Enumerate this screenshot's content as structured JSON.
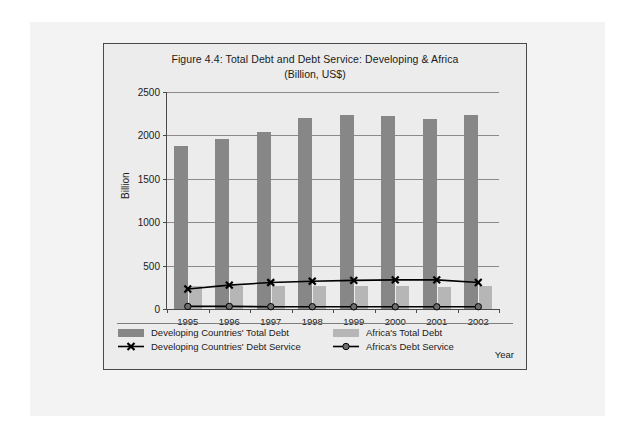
{
  "figure": {
    "title": "Figure 4.4: Total Debt and Debt Service: Developing & Africa",
    "subtitle": "(Billion, US$)",
    "axis_title_y": "Billion",
    "axis_title_x": "Year"
  },
  "legend": {
    "items": [
      {
        "label": "Developing Countries' Total Debt",
        "marker": "swatch-dark-gray"
      },
      {
        "label": "Developing Countries' Debt Service",
        "marker": "line-with-x-marker"
      },
      {
        "label": "Africa's Total Debt",
        "marker": "swatch-light-gray"
      },
      {
        "label": "Africa's Debt Service",
        "marker": "line-with-dot-marker"
      }
    ]
  },
  "yticks": [
    "0",
    "500",
    "1000",
    "1500",
    "2000",
    "2500"
  ],
  "colors": {
    "bar_developing": "#878787",
    "bar_africa": "#b6b6b6",
    "line": "#000000",
    "plot_background": "#ececec",
    "gridline": "#8a8a8a",
    "axis": "#4a4a4a"
  },
  "chart_data": {
    "type": "bar",
    "title": "Figure 4.4: Total Debt and Debt Service: Developing & Africa (Billion, US$)",
    "xlabel": "Year",
    "ylabel": "Billion",
    "ylim": [
      0,
      2500
    ],
    "ytick_step": 500,
    "grid": true,
    "legend_position": "bottom",
    "categories": [
      "1995",
      "1996",
      "1997",
      "1998",
      "1999",
      "2000",
      "2001",
      "2002"
    ],
    "series": [
      {
        "name": "Developing Countries' Total Debt",
        "type": "bar",
        "color": "#878787",
        "values": [
          1880,
          1960,
          2040,
          2200,
          2240,
          2220,
          2190,
          2240
        ]
      },
      {
        "name": "Africa's Total Debt",
        "type": "bar",
        "color": "#b6b6b6",
        "values": [
          265,
          265,
          265,
          270,
          265,
          260,
          255,
          270
        ]
      },
      {
        "name": "Developing Countries' Debt Service",
        "type": "line",
        "color": "#000000",
        "marker": "x",
        "values": [
          230,
          275,
          305,
          320,
          330,
          335,
          335,
          305
        ]
      },
      {
        "name": "Africa's Debt Service",
        "type": "line",
        "color": "#000000",
        "marker": "o",
        "values": [
          30,
          30,
          27,
          27,
          25,
          25,
          25,
          27
        ]
      }
    ]
  }
}
